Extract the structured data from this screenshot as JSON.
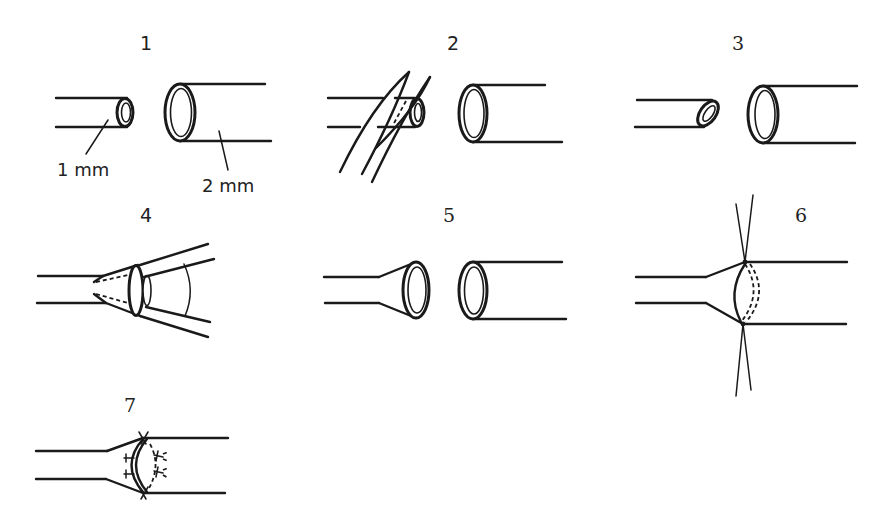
{
  "figure": {
    "steps": [
      {
        "id": 1,
        "label": "1",
        "description": "Two vessels of unequal diameter",
        "annotations": [
          "1 mm",
          "2 mm"
        ]
      },
      {
        "id": 2,
        "label": "2",
        "description": "Smaller vessel end cut obliquely with scissors"
      },
      {
        "id": 3,
        "label": "3",
        "description": "Obliquely cut smaller vessel beside larger vessel"
      },
      {
        "id": 4,
        "label": "4",
        "description": "Smaller vessel end dilated with forceps"
      },
      {
        "id": 5,
        "label": "5",
        "description": "Flared smaller vessel opposite larger vessel"
      },
      {
        "id": 6,
        "label": "6",
        "description": "Stay sutures placed at top and bottom"
      },
      {
        "id": 7,
        "label": "7",
        "description": "Interrupted sutures completing the anastomosis"
      }
    ],
    "colors": {
      "ink": "#1a1a1a",
      "background": "#ffffff"
    }
  }
}
